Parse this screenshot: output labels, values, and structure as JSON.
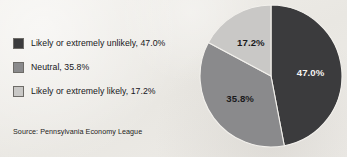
{
  "chart_data": {
    "type": "pie",
    "title": "",
    "categories": [
      "Likely or extremely unlikely",
      "Neutral",
      "Likely or extremely likely"
    ],
    "values": [
      47.0,
      35.8,
      17.2
    ],
    "value_labels": [
      "47.0%",
      "35.8%",
      "17.2%"
    ],
    "colors": [
      "#3b3b3d",
      "#8a8a8c",
      "#c9c8c6"
    ],
    "legend_position": "left",
    "grid": false,
    "start_angle_deg": 0,
    "direction": "clockwise",
    "source": "Source: Pennsylvania Economy League"
  },
  "legend": {
    "items": [
      {
        "label": "Likely or extremely unlikely, 47.0%",
        "swatch_color": "#3b3b3d",
        "swatch_name": "legend-swatch-unlikely"
      },
      {
        "label": "Neutral, 35.8%",
        "swatch_color": "#8a8a8c",
        "swatch_name": "legend-swatch-neutral"
      },
      {
        "label": "Likely or extremely likely, 17.2%",
        "swatch_color": "#c9c8c6",
        "swatch_name": "legend-swatch-likely"
      }
    ]
  },
  "pie": {
    "slices": [
      {
        "label": "47.0%",
        "color": "#3b3b3d",
        "label_color": "#f4f3f1"
      },
      {
        "label": "35.8%",
        "color": "#8a8a8c",
        "label_color": "#1a1a1c"
      },
      {
        "label": "17.2%",
        "color": "#c9c8c6",
        "label_color": "#1a1a1c"
      }
    ]
  },
  "footer": {
    "source": "Source: Pennsylvania Economy League"
  }
}
